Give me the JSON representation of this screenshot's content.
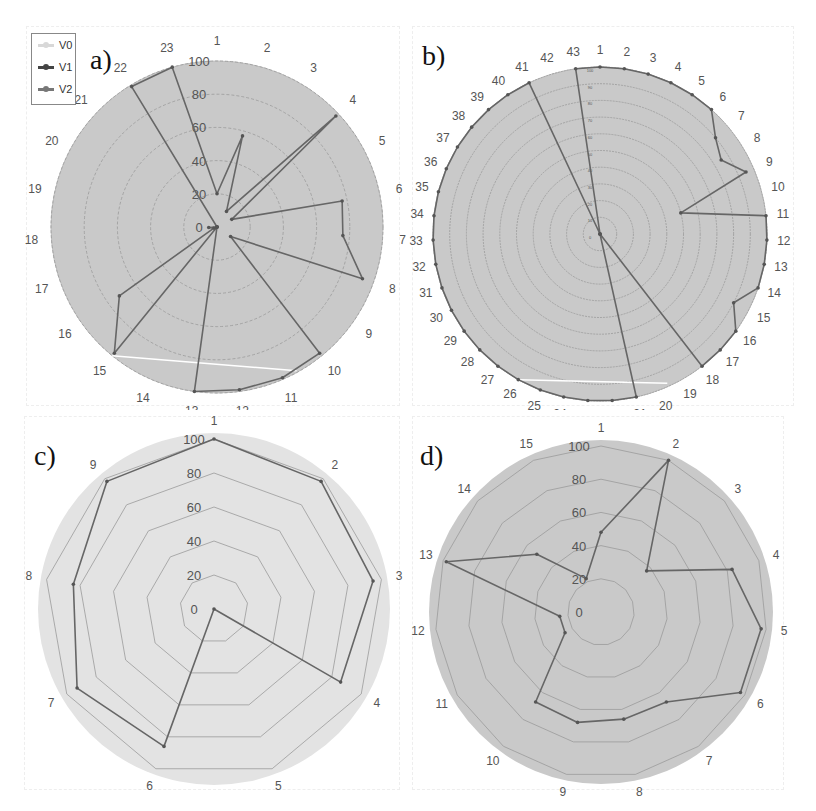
{
  "legend": {
    "items": [
      {
        "label": "V0",
        "color": "#d8d8d8"
      },
      {
        "label": "V1",
        "color": "#444444"
      },
      {
        "label": "V2",
        "color": "#777777"
      }
    ]
  },
  "panels": [
    {
      "label": "a)"
    },
    {
      "label": "b)"
    },
    {
      "label": "c)"
    },
    {
      "label": "d)"
    }
  ],
  "colors": {
    "page_background": "#ffffff",
    "plot_fill_dark": "#c9c9c9",
    "plot_fill_light": "#e3e3e3",
    "grid": "#9a9a9a",
    "series_line": "#666666",
    "v0_line": "#ffffff",
    "axis_label": "#555555"
  },
  "chart_data": [
    {
      "type": "radar",
      "title": "a)",
      "categories": [
        "1",
        "2",
        "3",
        "4",
        "5",
        "6",
        "7",
        "8",
        "9",
        "10",
        "11",
        "12",
        "13",
        "14",
        "15",
        "16",
        "17",
        "18",
        "19",
        "20",
        "21",
        "22",
        "23"
      ],
      "radial_ticks": [
        "0",
        "20",
        "40",
        "60",
        "80",
        "100"
      ],
      "rlim": [
        0,
        100
      ],
      "grid_shape": "circle",
      "legend": [
        "V0",
        "V1",
        "V2"
      ],
      "legend_position": "top-left",
      "series": [
        {
          "name": "V2",
          "values": [
            20,
            57,
            11,
            98,
            10,
            77,
            76,
            93,
            10,
            98,
            99,
            99,
            100,
            0,
            98,
            72,
            2,
            5,
            0,
            0,
            0,
            99,
            100
          ]
        },
        {
          "name": "V0",
          "segment_only": true,
          "values_note": "white line from axis 15 to between axes 10 and 11 at outer ring"
        }
      ]
    },
    {
      "type": "radar",
      "title": "b)",
      "categories": [
        "1",
        "2",
        "3",
        "4",
        "5",
        "6",
        "7",
        "8",
        "9",
        "10",
        "11",
        "12",
        "13",
        "14",
        "15",
        "16",
        "17",
        "18",
        "19",
        "20",
        "21",
        "22",
        "23",
        "24",
        "25",
        "26",
        "27",
        "28",
        "29",
        "30",
        "31",
        "32",
        "33",
        "34",
        "35",
        "36",
        "37",
        "38",
        "39",
        "40",
        "41",
        "42",
        "43"
      ],
      "radial_ticks": [
        "0",
        "10",
        "20",
        "30",
        "40",
        "50",
        "60",
        "70",
        "80",
        "90",
        "100"
      ],
      "rlim": [
        0,
        100
      ],
      "grid_shape": "circle",
      "series": [
        {
          "name": "V2",
          "values": [
            100,
            100,
            100,
            100,
            100,
            100,
            90,
            85,
            95,
            50,
            100,
            100,
            100,
            100,
            90,
            100,
            100,
            100,
            0,
            0,
            100,
            100,
            100,
            100,
            100,
            100,
            100,
            100,
            100,
            100,
            100,
            100,
            100,
            100,
            100,
            100,
            100,
            100,
            100,
            100,
            100,
            0,
            100
          ]
        },
        {
          "name": "V0",
          "segment_only": true,
          "values_note": "white line from axis 26 to between axes 19 and 20 at outer ring"
        }
      ]
    },
    {
      "type": "radar",
      "title": "c)",
      "categories": [
        "1",
        "2",
        "3",
        "4",
        "5",
        "6",
        "7",
        "8",
        "9"
      ],
      "radial_ticks": [
        "0",
        "20",
        "40",
        "60",
        "80",
        "100"
      ],
      "rlim": [
        0,
        100
      ],
      "grid_shape": "polygon",
      "series": [
        {
          "name": "V2",
          "values": [
            100,
            98,
            95,
            86,
            0,
            86,
            93,
            84,
            98
          ]
        }
      ]
    },
    {
      "type": "radar",
      "title": "d)",
      "categories": [
        "1",
        "2",
        "3",
        "4",
        "5",
        "6",
        "7",
        "8",
        "9",
        "10",
        "11",
        "12",
        "13",
        "14",
        "15"
      ],
      "radial_ticks": [
        "0",
        "20",
        "40",
        "60",
        "80",
        "100"
      ],
      "rlim": [
        0,
        100
      ],
      "grid_shape": "polygon",
      "series": [
        {
          "name": "V2",
          "values": [
            48,
            100,
            37,
            83,
            97,
            97,
            67,
            66,
            68,
            67,
            25,
            25,
            98,
            52,
            22
          ]
        }
      ]
    }
  ]
}
